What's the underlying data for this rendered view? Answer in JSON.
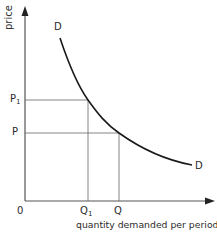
{
  "diagram": {
    "y_axis_label": "price",
    "x_axis_label": "quantity demanded per period",
    "origin_label": "0",
    "curve_labels": {
      "start": "D",
      "end": "D"
    },
    "price_levels": [
      {
        "label": "P",
        "subscript": "1"
      },
      {
        "label": "P",
        "subscript": ""
      }
    ],
    "quantity_levels": [
      {
        "label": "Q",
        "subscript": "1"
      },
      {
        "label": "Q",
        "subscript": ""
      }
    ],
    "colors": {
      "axis": "#555555",
      "curve": "#1a1a1a",
      "guides": "#666666",
      "text": "#2a2a2a"
    }
  }
}
